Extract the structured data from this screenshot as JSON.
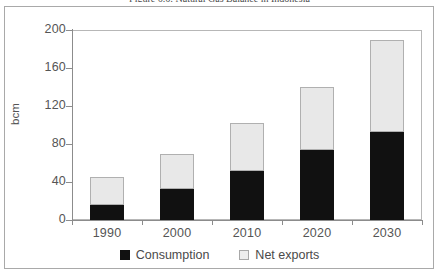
{
  "figure": {
    "caption": "Figure 6.6: Natural Gas Balance in Indonesia"
  },
  "chart_data": {
    "type": "bar",
    "stacked": true,
    "title": "Figure 6.6: Natural Gas Balance in Indonesia",
    "xlabel": "",
    "ylabel": "bcm",
    "ylim": [
      0,
      200
    ],
    "yticks": [
      0,
      40,
      80,
      120,
      160,
      200
    ],
    "ytick_labels": [
      "0",
      "40",
      "80",
      "120",
      "160",
      "200"
    ],
    "grid": false,
    "legend_position": "bottom",
    "categories": [
      "1990",
      "2000",
      "2010",
      "2020",
      "2030"
    ],
    "series": [
      {
        "name": "Consumption",
        "color": "#111111",
        "values": [
          16,
          33,
          52,
          74,
          93
        ]
      },
      {
        "name": "Net exports",
        "color": "#e8e8e8",
        "values": [
          29,
          37,
          50,
          66,
          96
        ]
      }
    ],
    "totals": [
      45,
      70,
      102,
      140,
      189
    ]
  },
  "legend": {
    "items": [
      {
        "label": "Consumption",
        "swatch": "consumption"
      },
      {
        "label": "Net exports",
        "swatch": "netexports"
      }
    ]
  }
}
